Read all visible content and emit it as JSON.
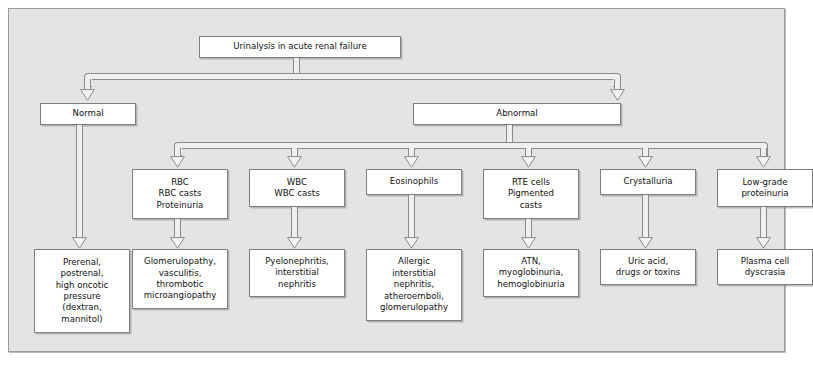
{
  "diagram": {
    "title": "Urinalysis in acute renal failure",
    "colors": {
      "panel_background": "#e4e4e4",
      "panel_border": "#9a9a9a",
      "node_fill": "#ffffff",
      "node_border": "#7d7d7d",
      "connector_line": "#8a8a8a",
      "connector_fill": "#efefef",
      "text": "#111111"
    },
    "root": {
      "id": "root",
      "label": "Urinalysis in acute renal failure"
    },
    "level2": [
      {
        "id": "normal",
        "label": "Normal"
      },
      {
        "id": "abnormal",
        "label": "Abnormal"
      }
    ],
    "findings": [
      {
        "id": "rbc",
        "label": "RBC\nRBC casts\nProteinuria"
      },
      {
        "id": "wbc",
        "label": "WBC\nWBC casts"
      },
      {
        "id": "eosinophils",
        "label": "Eosinophils"
      },
      {
        "id": "rte",
        "label": "RTE cells\nPigmented\ncasts"
      },
      {
        "id": "crystalluria",
        "label": "Crystalluria"
      },
      {
        "id": "lowgrade",
        "label": "Low-grade\nproteinuria"
      }
    ],
    "diagnoses": [
      {
        "id": "prerenal",
        "label": "Prerenal,\npostrenal,\nhigh oncotic\npressure\n(dextran,\nmannitol)"
      },
      {
        "id": "glomerulopathy",
        "label": "Glomerulopathy,\nvasculitis,\nthrombotic\nmicroangiopathy"
      },
      {
        "id": "pyelonephritis",
        "label": "Pyelonephritis,\ninterstitial\nnephritis"
      },
      {
        "id": "allergic",
        "label": "Allergic\ninterstitial\nnephritis,\natheroemboli,\nglomerulopathy"
      },
      {
        "id": "atn",
        "label": "ATN,\nmyoglobinuria,\nhemoglobinuria"
      },
      {
        "id": "uricacid",
        "label": "Uric acid,\ndrugs or toxins"
      },
      {
        "id": "plasmacell",
        "label": "Plasma cell\ndyscrasia"
      }
    ]
  }
}
